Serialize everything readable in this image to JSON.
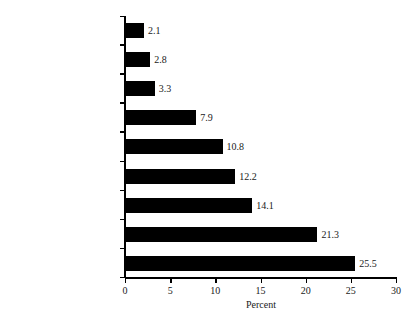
{
  "chart_data": {
    "type": "bar",
    "orientation": "horizontal",
    "title": "",
    "xlabel": "Percent",
    "ylabel": "",
    "xlim": [
      0,
      30
    ],
    "xticks": [
      0,
      5,
      10,
      15,
      20,
      25,
      30
    ],
    "xtick_labels": [
      "0",
      "5",
      "10",
      "15",
      "20",
      "25",
      "30"
    ],
    "grid": false,
    "legend": false,
    "bar_color": "#000000",
    "axis_color": "#000000",
    "background_color": "#ffffff",
    "categories": [
      "Other",
      "Risk to Maternal Health",
      "Risk to Fetal Health",
      "Want No More Children",
      "Disrupt Education/Job",
      "Too Young; Parents Object",
      "Problems w/ Partner",
      "Cannot Afford a Child",
      "Postpone Childbearing"
    ],
    "values": [
      2.1,
      2.8,
      3.3,
      7.9,
      10.8,
      12.2,
      14.1,
      21.3,
      25.5
    ],
    "value_labels": [
      "2.1",
      "2.8",
      "3.3",
      "7.9",
      "10.8",
      "12.2",
      "14.1",
      "21.3",
      "25.5"
    ],
    "bars": [
      {
        "category": "Other",
        "value": 2.1,
        "label": "2.1"
      },
      {
        "category": "Risk to Maternal Health",
        "value": 2.8,
        "label": "2.8"
      },
      {
        "category": "Risk to Fetal Health",
        "value": 3.3,
        "label": "3.3"
      },
      {
        "category": "Want No More Children",
        "value": 7.9,
        "label": "7.9"
      },
      {
        "category": "Disrupt Education/Job",
        "value": 10.8,
        "label": "10.8"
      },
      {
        "category": "Too Young; Parents Object",
        "value": 12.2,
        "label": "12.2"
      },
      {
        "category": "Problems w/ Partner",
        "value": 14.1,
        "label": "14.1"
      },
      {
        "category": "Cannot Afford a Child",
        "value": 21.3,
        "label": "21.3"
      },
      {
        "category": "Postpone Childbearing",
        "value": 25.5,
        "label": "25.5"
      }
    ]
  }
}
